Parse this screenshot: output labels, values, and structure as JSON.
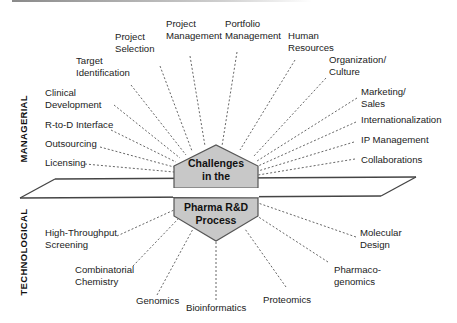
{
  "center": {
    "top_line1": "Challenges",
    "top_line2": "in the",
    "bottom_line1": "Pharma R&D",
    "bottom_line2": "Process",
    "fill_color": "#c8c8c8",
    "stroke_color": "#555555"
  },
  "sides": {
    "managerial": "MANAGERIAL",
    "technological": "TECHNOLOGICAL"
  },
  "managerial_items": [
    {
      "line1": "Licensing",
      "line2": ""
    },
    {
      "line1": "Outsourcing",
      "line2": ""
    },
    {
      "line1": "R-to-D Interface",
      "line2": ""
    },
    {
      "line1": "Clinical",
      "line2": "Development"
    },
    {
      "line1": "Target",
      "line2": "Identification"
    },
    {
      "line1": "Project",
      "line2": "Selection"
    },
    {
      "line1": "Project",
      "line2": "Management"
    },
    {
      "line1": "Portfolio",
      "line2": "Management"
    },
    {
      "line1": "Human",
      "line2": "Resources"
    },
    {
      "line1": "Organization/",
      "line2": "Culture"
    },
    {
      "line1": "Marketing/",
      "line2": "Sales"
    },
    {
      "line1": "Internationalization",
      "line2": ""
    },
    {
      "line1": "IP Management",
      "line2": ""
    },
    {
      "line1": "Collaborations",
      "line2": ""
    }
  ],
  "technological_items": [
    {
      "line1": "High-Throughput",
      "line2": "Screening"
    },
    {
      "line1": "Combinatorial",
      "line2": "Chemistry"
    },
    {
      "line1": "Genomics",
      "line2": ""
    },
    {
      "line1": "Bioinformatics",
      "line2": ""
    },
    {
      "line1": "Proteomics",
      "line2": ""
    },
    {
      "line1": "Pharmaco-",
      "line2": "genomics"
    },
    {
      "line1": "Molecular",
      "line2": "Design"
    }
  ]
}
